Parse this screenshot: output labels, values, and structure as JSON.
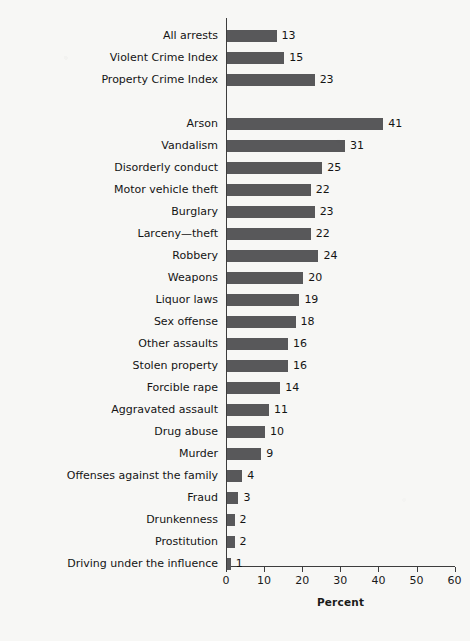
{
  "chart_data": {
    "type": "bar",
    "orientation": "horizontal",
    "title": "",
    "xlabel": "Percent",
    "ylabel": "",
    "xlim": [
      0,
      60
    ],
    "xticks": [
      0,
      10,
      20,
      30,
      40,
      50,
      60
    ],
    "xticklabels": [
      "0",
      "10",
      "20",
      "30",
      "40",
      "50",
      "60"
    ],
    "grid": false,
    "legend": null,
    "bar_color": "#58585a",
    "value_labels": true,
    "groups": [
      {
        "name": "summary",
        "categories": [
          "All arrests",
          "Violent Crime Index",
          "Property Crime Index"
        ],
        "values": [
          13,
          15,
          23
        ]
      },
      {
        "name": "offenses",
        "categories": [
          "Arson",
          "Vandalism",
          "Disorderly conduct",
          "Motor vehicle theft",
          "Burglary",
          "Larceny—theft",
          "Robbery",
          "Weapons",
          "Liquor laws",
          "Sex offense",
          "Other assaults",
          "Stolen property",
          "Forcible rape",
          "Aggravated assault",
          "Drug abuse",
          "Murder",
          "Offenses against the family",
          "Fraud",
          "Drunkenness",
          "Prostitution",
          "Driving under the influence"
        ],
        "values": [
          41,
          31,
          25,
          22,
          23,
          22,
          24,
          20,
          19,
          18,
          16,
          16,
          14,
          11,
          10,
          9,
          4,
          3,
          2,
          2,
          1
        ]
      }
    ],
    "categories": [
      "All arrests",
      "Violent Crime Index",
      "Property Crime Index",
      "Arson",
      "Vandalism",
      "Disorderly conduct",
      "Motor vehicle theft",
      "Burglary",
      "Larceny—theft",
      "Robbery",
      "Weapons",
      "Liquor laws",
      "Sex offense",
      "Other assaults",
      "Stolen property",
      "Forcible rape",
      "Aggravated assault",
      "Drug abuse",
      "Murder",
      "Offenses against the family",
      "Fraud",
      "Drunkenness",
      "Prostitution",
      "Driving under the influence"
    ],
    "values": [
      13,
      15,
      23,
      41,
      31,
      25,
      22,
      23,
      22,
      24,
      20,
      19,
      18,
      16,
      16,
      14,
      11,
      10,
      9,
      4,
      3,
      2,
      2,
      1
    ]
  },
  "layout": {
    "x0_px": 226,
    "px_per_unit": 3.81,
    "first_row_top_px": 30,
    "row_pitch_px": 22,
    "group_gap_px": 22,
    "bar_height_px": 12
  }
}
